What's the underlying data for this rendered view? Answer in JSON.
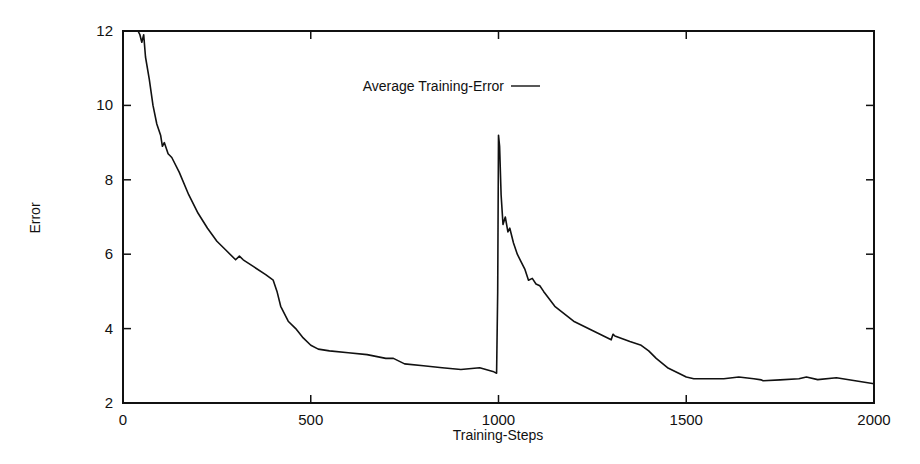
{
  "chart_data": {
    "type": "line",
    "title": "",
    "xlabel": "Training-Steps",
    "ylabel": "Error",
    "xlim": [
      0,
      2000
    ],
    "ylim": [
      2,
      12
    ],
    "xticks": [
      0,
      500,
      1000,
      1500,
      2000
    ],
    "yticks": [
      2,
      4,
      6,
      8,
      10,
      12
    ],
    "grid": false,
    "legend_position": "top-center (inside)",
    "series": [
      {
        "name": "Average Training-Error",
        "color": "#111111",
        "x": [
          40,
          45,
          50,
          55,
          60,
          70,
          80,
          90,
          100,
          105,
          110,
          120,
          130,
          150,
          175,
          200,
          225,
          250,
          275,
          300,
          310,
          320,
          350,
          380,
          400,
          410,
          420,
          440,
          460,
          480,
          500,
          520,
          550,
          600,
          650,
          700,
          720,
          750,
          800,
          850,
          900,
          950,
          985,
          995,
          998,
          1000,
          1003,
          1007,
          1012,
          1018,
          1025,
          1030,
          1040,
          1050,
          1060,
          1070,
          1080,
          1090,
          1100,
          1110,
          1120,
          1150,
          1200,
          1250,
          1300,
          1305,
          1310,
          1350,
          1380,
          1400,
          1420,
          1450,
          1480,
          1500,
          1520,
          1550,
          1600,
          1640,
          1680,
          1700,
          1705,
          1750,
          1800,
          1820,
          1850,
          1900,
          1950,
          2000
        ],
        "y": [
          12.0,
          11.9,
          11.7,
          11.9,
          11.3,
          10.7,
          10.0,
          9.5,
          9.2,
          8.9,
          9.0,
          8.7,
          8.6,
          8.2,
          7.6,
          7.1,
          6.7,
          6.35,
          6.1,
          5.85,
          5.95,
          5.85,
          5.65,
          5.45,
          5.3,
          5.0,
          4.6,
          4.2,
          4.0,
          3.75,
          3.55,
          3.45,
          3.4,
          3.35,
          3.3,
          3.2,
          3.2,
          3.05,
          3.0,
          2.95,
          2.9,
          2.95,
          2.85,
          2.8,
          5.0,
          9.2,
          8.9,
          7.6,
          6.8,
          7.0,
          6.6,
          6.7,
          6.3,
          6.0,
          5.8,
          5.6,
          5.3,
          5.35,
          5.2,
          5.15,
          5.0,
          4.6,
          4.2,
          3.95,
          3.7,
          3.85,
          3.8,
          3.65,
          3.55,
          3.4,
          3.2,
          2.95,
          2.8,
          2.7,
          2.65,
          2.65,
          2.65,
          2.7,
          2.65,
          2.62,
          2.6,
          2.62,
          2.65,
          2.7,
          2.63,
          2.68,
          2.6,
          2.52
        ]
      }
    ]
  },
  "labels": {
    "xlabel": "Training-Steps",
    "ylabel": "Error",
    "legend": "Average Training-Error"
  }
}
